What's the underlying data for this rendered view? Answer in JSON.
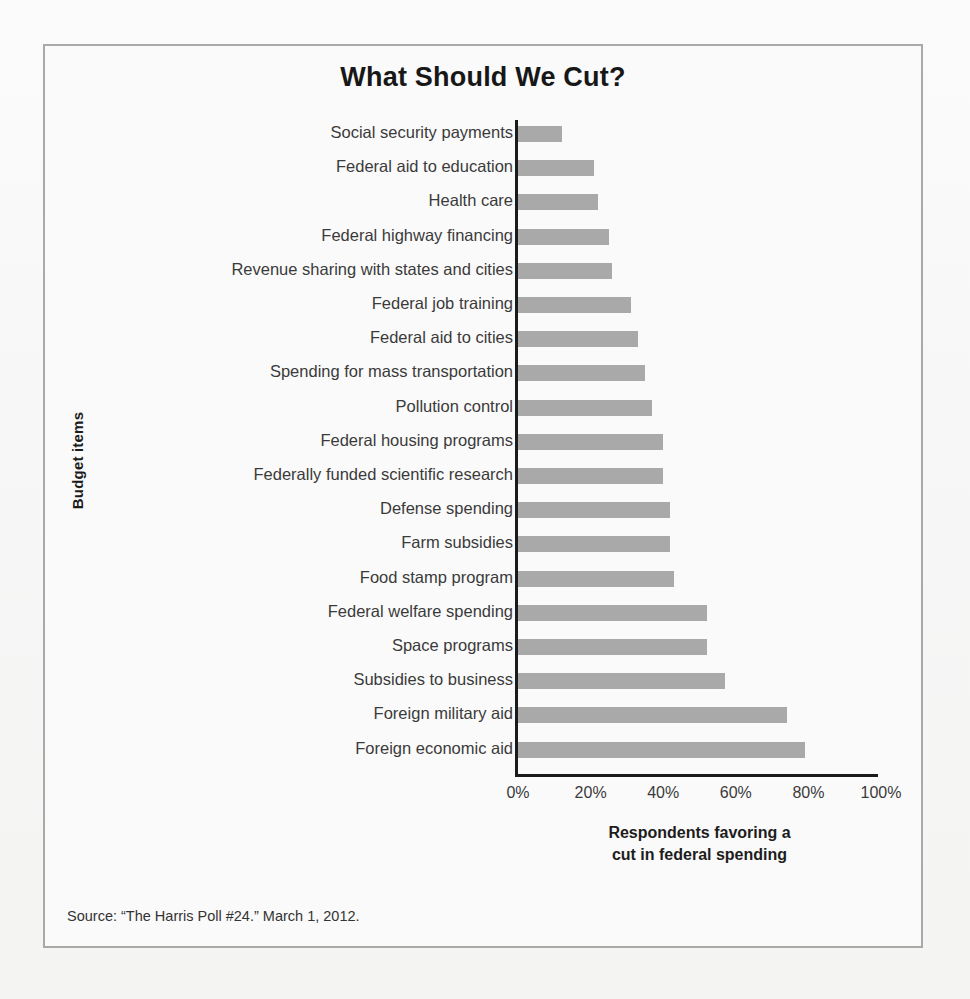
{
  "figure": {
    "title": "What Should We Cut?",
    "source_note": "Source: “The Harris Poll #24.” March 1, 2012.",
    "frame_border_color": "#a9a9a9",
    "page_background": "#f7f7f6"
  },
  "axes": {
    "y_title": "Budget items",
    "x_title_line1": "Respondents favoring a",
    "x_title_line2": "cut in federal spending"
  },
  "chart_data": {
    "type": "bar",
    "orientation": "horizontal",
    "title": "What Should We Cut?",
    "xlabel": "Respondents favoring a cut in federal spending",
    "ylabel": "Budget items",
    "xlim": [
      0,
      100
    ],
    "xticks": [
      0,
      20,
      40,
      60,
      80,
      100
    ],
    "xtick_labels": [
      "0%",
      "20%",
      "40%",
      "60%",
      "80%",
      "100%"
    ],
    "grid": false,
    "legend": null,
    "bar_color": "#a9a9a9",
    "value_unit": "%",
    "categories": [
      "Social security payments",
      "Federal aid to education",
      "Health care",
      "Federal highway financing",
      "Revenue sharing with states and cities",
      "Federal job training",
      "Federal aid to cities",
      "Spending for mass transportation",
      "Pollution control",
      "Federal housing programs",
      "Federally funded scientific research",
      "Defense spending",
      "Farm subsidies",
      "Food stamp program",
      "Federal welfare spending",
      "Space programs",
      "Subsidies to business",
      "Foreign military aid",
      "Foreign economic aid"
    ],
    "values": [
      12,
      21,
      22,
      25,
      26,
      31,
      33,
      35,
      37,
      40,
      40,
      42,
      42,
      43,
      52,
      52,
      57,
      74,
      79
    ]
  },
  "ghost_marks": [
    {
      "text": "....  ......",
      "left": 60,
      "top": 62
    },
    {
      "text": "......  ...",
      "left": 690,
      "top": 58
    },
    {
      "text": ". ... ..",
      "left": 52,
      "top": 300
    },
    {
      "text": ".. ....",
      "left": 700,
      "top": 430
    },
    {
      "text": "... ..",
      "left": 66,
      "top": 700
    },
    {
      "text": ".. ...",
      "left": 760,
      "top": 860
    }
  ]
}
